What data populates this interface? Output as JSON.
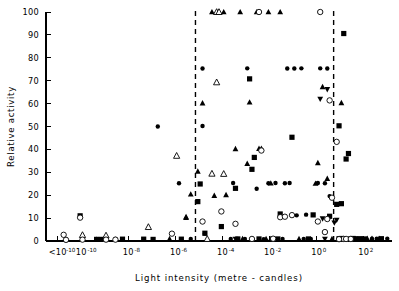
{
  "figure": {
    "title": "",
    "xlabel": "Light  intensity  (metre - candles)",
    "ylabel": "Relative activity"
  },
  "axes": {
    "y_ticks": [
      "0",
      "10",
      "20",
      "30",
      "40",
      "50",
      "60",
      "70",
      "80",
      "90",
      "100"
    ],
    "x_ticks": [
      {
        "label": "<10",
        "exp": "-10"
      },
      {
        "label": "10",
        "exp": "-10"
      },
      {
        "label": "10",
        "exp": "-8"
      },
      {
        "label": "10",
        "exp": "-6"
      },
      {
        "label": "10",
        "exp": "-4"
      },
      {
        "label": "10",
        "exp": "-2"
      },
      {
        "label": "10",
        "exp": "0"
      },
      {
        "label": "10",
        "exp": "2"
      }
    ]
  },
  "chart_data": {
    "type": "scatter",
    "title": "",
    "xlabel": "Light intensity (metre - candles)",
    "ylabel": "Relative activity",
    "xscale": "log",
    "xlim": [
      -11.5,
      3.2
    ],
    "ylim": [
      0,
      100
    ],
    "grid": false,
    "legend": "none",
    "xtick_values": [
      -11,
      -10,
      -8,
      -6,
      -4,
      -2,
      0,
      2
    ],
    "xtick_labels": [
      "<10^-10",
      "10^-10",
      "10^-8",
      "10^-6",
      "10^-4",
      "10^-2",
      "10^0",
      "10^2"
    ],
    "ytick_values": [
      0,
      10,
      20,
      30,
      40,
      50,
      60,
      70,
      80,
      90,
      100
    ],
    "annotations": [
      {
        "type": "vline",
        "x": -5.15,
        "style": "dashed",
        "label": ""
      },
      {
        "type": "vline",
        "x": 0.72,
        "style": "dashed",
        "label": ""
      }
    ],
    "marker_types": [
      "filled-square",
      "filled-triangle-up",
      "filled-triangle-down",
      "open-triangle-up",
      "open-circle",
      "filled-circle"
    ],
    "series": [
      {
        "name": "filled-circle",
        "marker": "filled-circle",
        "points": [
          [
            -6.75,
            50.0
          ],
          [
            -5.85,
            25.2
          ],
          [
            -4.85,
            75.3
          ],
          [
            -4.85,
            50.2
          ],
          [
            -3.55,
            25.3
          ],
          [
            -2.95,
            75.4
          ],
          [
            -2.55,
            22.8
          ],
          [
            -2.05,
            25.2
          ],
          [
            -1.75,
            25.3
          ],
          [
            -1.25,
            75.3
          ],
          [
            -0.95,
            75.3
          ],
          [
            -0.65,
            75.4
          ],
          [
            -1.35,
            25.2
          ],
          [
            -1.15,
            25.3
          ],
          [
            0.05,
            25.3
          ],
          [
            0.35,
            25.2
          ],
          [
            0.15,
            75.4
          ],
          [
            0.45,
            75.3
          ],
          [
            -4.75,
            3.2
          ],
          [
            -3.05,
            0.9
          ],
          [
            -2.25,
            0.8
          ],
          [
            -1.45,
            0.9
          ],
          [
            -0.55,
            0.9
          ],
          [
            -0.25,
            0.9
          ],
          [
            1.35,
            0.9
          ],
          [
            1.95,
            1.0
          ],
          [
            2.35,
            1.0
          ],
          [
            2.55,
            1.0
          ],
          [
            -0.85,
            11.2
          ],
          [
            -0.45,
            11.5
          ],
          [
            0.55,
            19.6
          ],
          [
            -1.85,
            0.8
          ],
          [
            -3.65,
            0.9
          ],
          [
            -5.35,
            0.9
          ],
          [
            -8.55,
            0.9
          ],
          [
            -9.35,
            0.9
          ],
          [
            1.55,
            0.9
          ],
          [
            1.75,
            0.9
          ],
          [
            3.0,
            1.0
          ]
        ]
      },
      {
        "name": "filled-square",
        "marker": "filled-square",
        "points": [
          [
            -10.05,
            11.0
          ],
          [
            -9.35,
            0.7
          ],
          [
            -9.15,
            0.7
          ],
          [
            -8.95,
            0.8
          ],
          [
            -8.25,
            0.8
          ],
          [
            -6.95,
            0.7
          ],
          [
            -5.75,
            0.8
          ],
          [
            -5.05,
            17.2
          ],
          [
            -4.95,
            24.9
          ],
          [
            -4.75,
            3.4
          ],
          [
            -4.05,
            6.3
          ],
          [
            -3.45,
            23.0
          ],
          [
            -2.75,
            31.3
          ],
          [
            -2.65,
            36.5
          ],
          [
            -2.85,
            70.8
          ],
          [
            -1.55,
            11.8
          ],
          [
            -1.05,
            45.3
          ],
          [
            0.85,
            16.0
          ],
          [
            1.15,
            90.6
          ],
          [
            1.35,
            38.2
          ],
          [
            1.25,
            35.8
          ],
          [
            0.55,
            10.8
          ],
          [
            -0.35,
            0.9
          ],
          [
            0.95,
            1.0
          ],
          [
            1.05,
            1.1
          ],
          [
            1.45,
            0.9
          ],
          [
            1.65,
            1.0
          ],
          [
            1.85,
            1.0
          ],
          [
            0.95,
            50.3
          ],
          [
            1.05,
            16.3
          ],
          [
            -3.35,
            0.9
          ],
          [
            -2.45,
            0.9
          ],
          [
            2.05,
            0.9
          ],
          [
            2.75,
            1.0
          ],
          [
            -1.65,
            0.9
          ],
          [
            1.55,
            1.1
          ],
          [
            -0.15,
            11.4
          ],
          [
            -7.35,
            0.8
          ]
        ]
      },
      {
        "name": "filled-triangle-up",
        "marker": "filled-triangle-up",
        "points": [
          [
            -5.35,
            20.4
          ],
          [
            -5.05,
            30.4
          ],
          [
            -4.85,
            60.2
          ],
          [
            -4.45,
            100.0
          ],
          [
            -3.95,
            100.0
          ],
          [
            -3.25,
            100.0
          ],
          [
            -2.55,
            100.0
          ],
          [
            -2.05,
            100.0
          ],
          [
            -1.55,
            100.0
          ],
          [
            -4.35,
            19.8
          ],
          [
            -3.85,
            20.1
          ],
          [
            -3.45,
            40.2
          ],
          [
            -2.95,
            33.8
          ],
          [
            -2.85,
            60.6
          ],
          [
            -2.45,
            40.3
          ],
          [
            -2.35,
            40.4
          ],
          [
            -1.95,
            25.2
          ],
          [
            0.25,
            67.3
          ],
          [
            0.05,
            34.1
          ],
          [
            0.45,
            27.2
          ],
          [
            -3.15,
            0.9
          ],
          [
            -2.15,
            0.9
          ],
          [
            -1.95,
            0.9
          ],
          [
            -0.75,
            0.9
          ],
          [
            0.65,
            0.9
          ],
          [
            2.15,
            1.0
          ],
          [
            2.35,
            1.0
          ],
          [
            2.65,
            1.0
          ],
          [
            -5.55,
            10.5
          ],
          [
            -5.55,
            10.2
          ],
          [
            -0.05,
            25.1
          ],
          [
            1.05,
            60.3
          ],
          [
            -6.25,
            0.9
          ]
        ]
      },
      {
        "name": "filled-triangle-down",
        "marker": "filled-triangle-down",
        "points": [
          [
            -3.45,
            0.9
          ],
          [
            0.25,
            9.8
          ],
          [
            0.85,
            9.2
          ],
          [
            0.45,
            66.2
          ],
          [
            0.75,
            8.0
          ],
          [
            1.05,
            1.0
          ],
          [
            0.35,
            0.9
          ],
          [
            0.15,
            62.0
          ]
        ]
      },
      {
        "name": "open-triangle-up",
        "marker": "open-triangle-up",
        "points": [
          [
            -9.95,
            2.6
          ],
          [
            -8.95,
            2.4
          ],
          [
            -7.15,
            6.1
          ],
          [
            -5.95,
            37.2
          ],
          [
            -4.25,
            69.3
          ],
          [
            -4.45,
            29.4
          ],
          [
            -3.95,
            29.3
          ],
          [
            -4.25,
            100.0
          ],
          [
            -4.15,
            100.0
          ],
          [
            -4.65,
            0.9
          ]
        ]
      },
      {
        "name": "open-circle",
        "marker": "open-circle",
        "points": [
          [
            -10.75,
            2.7
          ],
          [
            -10.65,
            0.5
          ],
          [
            -10.05,
            10.2
          ],
          [
            -9.95,
            0.6
          ],
          [
            -8.95,
            0.6
          ],
          [
            -8.55,
            0.6
          ],
          [
            -6.15,
            3.2
          ],
          [
            -4.85,
            8.5
          ],
          [
            -4.05,
            12.9
          ],
          [
            -3.45,
            7.5
          ],
          [
            -2.35,
            39.5
          ],
          [
            -1.55,
            10.4
          ],
          [
            -1.35,
            10.6
          ],
          [
            -1.05,
            11.3
          ],
          [
            -2.45,
            100.0
          ],
          [
            0.55,
            61.4
          ],
          [
            0.85,
            43.3
          ],
          [
            0.65,
            18.9
          ],
          [
            0.45,
            9.6
          ],
          [
            0.35,
            3.9
          ],
          [
            1.15,
            0.9
          ],
          [
            1.25,
            0.9
          ],
          [
            0.95,
            0.8
          ],
          [
            1.45,
            0.9
          ],
          [
            -1.85,
            1.0
          ],
          [
            -2.75,
            0.9
          ],
          [
            0.05,
            8.5
          ],
          [
            0.15,
            100.0
          ]
        ]
      }
    ]
  }
}
